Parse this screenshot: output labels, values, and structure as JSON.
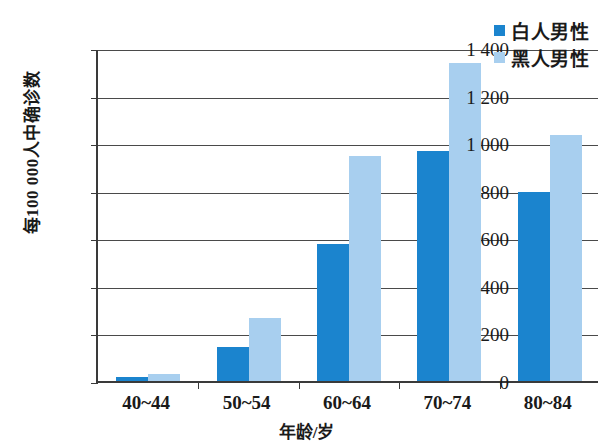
{
  "chart_data": {
    "type": "bar",
    "title": "",
    "xlabel": "年龄/岁",
    "ylabel": "每100 000人中确诊数",
    "categories": [
      "40~44",
      "50~54",
      "60~64",
      "70~74",
      "80~84"
    ],
    "series": [
      {
        "name": "白人男性",
        "color": "#1b84ce",
        "values": [
          15,
          145,
          578,
          965,
          795
        ]
      },
      {
        "name": "黑人男性",
        "color": "#a8cfef",
        "values": [
          28,
          265,
          945,
          1335,
          1035
        ]
      }
    ],
    "ylim": [
      0,
      1400
    ],
    "ytick_labels": [
      "0",
      "200",
      "400",
      "600",
      "800",
      "1 000",
      "1 200",
      "1 400"
    ],
    "ytick_values": [
      0,
      200,
      400,
      600,
      800,
      1000,
      1200,
      1400
    ],
    "grid": true,
    "legend_position": "top-right"
  }
}
